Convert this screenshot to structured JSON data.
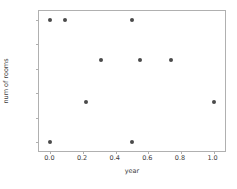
{
  "chart_data": {
    "type": "scatter",
    "title": "",
    "xlabel": "year",
    "ylabel": "num of rooms",
    "xlim": [
      -0.07,
      1.07
    ],
    "ylim": [
      -0.07,
      1.07
    ],
    "grid": false,
    "legend": null,
    "marker_color": "#4a4a4a",
    "xticks": [
      0.0,
      0.2,
      0.4,
      0.6,
      0.8,
      1.0
    ],
    "yticks": [
      0.0,
      0.2,
      0.4,
      0.6,
      0.8,
      1.0
    ],
    "xtick_labels": [
      "0.0",
      "0.2",
      "0.4",
      "0.6",
      "0.8",
      "1.0"
    ],
    "ytick_labels": [
      "0.0",
      "0.2",
      "0.4",
      "0.6",
      "0.8",
      "1.0"
    ],
    "points": [
      {
        "x": 0.0,
        "y": 1.0
      },
      {
        "x": 0.09,
        "y": 1.0
      },
      {
        "x": 0.5,
        "y": 1.0
      },
      {
        "x": 0.31,
        "y": 0.667
      },
      {
        "x": 0.55,
        "y": 0.667
      },
      {
        "x": 0.74,
        "y": 0.667
      },
      {
        "x": 0.22,
        "y": 0.333
      },
      {
        "x": 1.0,
        "y": 0.333
      },
      {
        "x": 0.0,
        "y": 0.0
      },
      {
        "x": 0.5,
        "y": 0.0
      }
    ]
  }
}
